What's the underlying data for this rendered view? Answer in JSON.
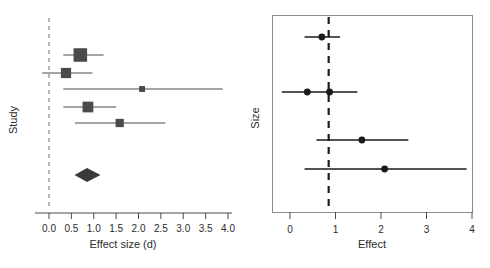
{
  "figure": {
    "kind": "forest-plot-pair",
    "background": "#ffffff",
    "marker_color": "#4a4a4a",
    "dot_color": "#1a1a1a",
    "refline_color_left": "#9a9a9a",
    "refline_color_right": "#1f1f1f",
    "frame_color": "#8c8c8c"
  },
  "chart_data": [
    {
      "id": "left-forest",
      "type": "scatter",
      "subtype": "forest-plot",
      "title": "",
      "xlabel": "Effect size (d)",
      "ylabel": "Study",
      "xlim": [
        -0.2,
        4.0
      ],
      "ylim": [
        0,
        6
      ],
      "grid": false,
      "legend": "none",
      "xticks": [
        0.0,
        0.5,
        1.0,
        1.5,
        2.0,
        2.5,
        3.0,
        3.5,
        4.0
      ],
      "xtick_labels": [
        "0.0",
        "0.5",
        "1.0",
        "1.5",
        "2.0",
        "2.5",
        "3.0",
        "3.5",
        "4.0"
      ],
      "yticks": [],
      "ytick_labels": [],
      "reference_line": {
        "x": 0.0,
        "style": "dashed",
        "color": "#9a9a9a"
      },
      "marker_shape": "square",
      "rows": [
        {
          "label": "Study 1",
          "estimate": 0.7,
          "ci_low": 0.32,
          "ci_high": 1.22,
          "weight": 0.95
        },
        {
          "label": "Study 2",
          "estimate": 0.38,
          "ci_low": -0.15,
          "ci_high": 0.97,
          "weight": 0.58
        },
        {
          "label": "Study 3",
          "estimate": 2.08,
          "ci_low": 0.32,
          "ci_high": 3.88,
          "weight": 0.1
        },
        {
          "label": "Study 4",
          "estimate": 0.87,
          "ci_low": 0.32,
          "ci_high": 1.5,
          "weight": 0.64
        },
        {
          "label": "Study 5",
          "estimate": 1.58,
          "ci_low": 0.58,
          "ci_high": 2.6,
          "weight": 0.36
        }
      ],
      "summary": {
        "label": "Overall",
        "estimate": 0.85,
        "ci_low": 0.57,
        "ci_high": 1.15,
        "shape": "diamond"
      }
    },
    {
      "id": "right-forest",
      "type": "scatter",
      "subtype": "forest-plot",
      "title": "",
      "xlabel": "Effect",
      "ylabel": "Size",
      "xlim": [
        -0.35,
        4.05
      ],
      "ylim": [
        0,
        5
      ],
      "grid": false,
      "legend": "none",
      "framed": true,
      "xticks": [
        0,
        1,
        2,
        3,
        4
      ],
      "xtick_labels": [
        "0",
        "1",
        "2",
        "3",
        "4"
      ],
      "yticks": [],
      "ytick_labels": [],
      "reference_line": {
        "x": 0.85,
        "style": "dashed",
        "color": "#1f1f1f"
      },
      "marker_shape": "circle",
      "rows": [
        {
          "label": "Row 1",
          "estimates": [
            0.7
          ],
          "ci_low": 0.32,
          "ci_high": 1.1
        },
        {
          "label": "Row 2",
          "estimates": [
            0.38,
            0.87
          ],
          "ci_low": -0.18,
          "ci_high": 1.48
        },
        {
          "label": "Row 3",
          "estimates": [
            1.58
          ],
          "ci_low": 0.58,
          "ci_high": 2.6
        },
        {
          "label": "Row 4",
          "estimates": [
            2.08
          ],
          "ci_low": 0.32,
          "ci_high": 3.88
        }
      ]
    }
  ],
  "left_panel": {
    "axis_title_x": "Effect size (d)",
    "axis_title_y": "Study",
    "tick_labels": [
      "0.0",
      "0.5",
      "1.0",
      "1.5",
      "2.0",
      "2.5",
      "3.0",
      "3.5",
      "4.0"
    ]
  },
  "right_panel": {
    "axis_title_x": "Effect",
    "axis_title_y": "Size",
    "tick_labels": [
      "0",
      "1",
      "2",
      "3",
      "4"
    ]
  }
}
